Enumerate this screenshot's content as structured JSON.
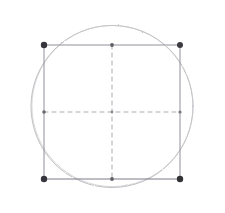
{
  "figure": {
    "title": "Square inscribed in a circle with dashed medians",
    "background_color": "#ffffff",
    "width": 225,
    "height": 213,
    "style": "hand-drawn pencil sketch, scanned, light gray strokes"
  },
  "chart_data": {
    "type": "scatter",
    "title": "Square inscribed in a circle with dashed medians",
    "xlabel": "",
    "ylabel": "",
    "grid": false,
    "legend": null,
    "xlim": [
      0,
      225
    ],
    "ylim": [
      0,
      213
    ],
    "shapes": [
      {
        "name": "circumscribed-circle",
        "kind": "circle",
        "cx": 112,
        "cy": 106.5,
        "r": 81,
        "stroke": "#b9b9bd",
        "stroke_width": 0.9,
        "dash": "none",
        "fill": "none"
      },
      {
        "name": "inscribed-square",
        "kind": "rect",
        "x": 44,
        "y": 45,
        "width": 136,
        "height": 134,
        "stroke": "#8e8e93",
        "stroke_width": 1.0,
        "dash": "none",
        "fill": "none"
      },
      {
        "name": "vertical-median",
        "kind": "line",
        "x1": 112,
        "y1": 45,
        "x2": 112,
        "y2": 179,
        "stroke": "#a8a8ad",
        "stroke_width": 0.9,
        "dash": "4 4"
      },
      {
        "name": "horizontal-median",
        "kind": "line",
        "x1": 44,
        "y1": 112,
        "x2": 180,
        "y2": 112,
        "stroke": "#a8a8ad",
        "stroke_width": 0.9,
        "dash": "4 4"
      }
    ],
    "points": [
      {
        "name": "vertex-top-left",
        "x": 44,
        "y": 45,
        "marker": "dot",
        "size": 3.4,
        "color": "#2f2f33"
      },
      {
        "name": "vertex-top-right",
        "x": 180,
        "y": 45,
        "marker": "dot",
        "size": 3.4,
        "color": "#2f2f33"
      },
      {
        "name": "vertex-bottom-left",
        "x": 44,
        "y": 179,
        "marker": "dot",
        "size": 3.4,
        "color": "#2f2f33"
      },
      {
        "name": "vertex-bottom-right",
        "x": 180,
        "y": 179,
        "marker": "dot",
        "size": 3.4,
        "color": "#2f2f33"
      },
      {
        "name": "midpoint-top",
        "x": 112,
        "y": 45,
        "marker": "dot",
        "size": 2.0,
        "color": "#5a5a5f"
      },
      {
        "name": "midpoint-bottom",
        "x": 112,
        "y": 179,
        "marker": "dot",
        "size": 2.0,
        "color": "#5a5a5f"
      },
      {
        "name": "midpoint-left",
        "x": 44,
        "y": 112,
        "marker": "dot",
        "size": 2.0,
        "color": "#5a5a5f"
      },
      {
        "name": "midpoint-right",
        "x": 180,
        "y": 112,
        "marker": "dot",
        "size": 2.0,
        "color": "#5a5a5f"
      },
      {
        "name": "center",
        "x": 112,
        "y": 112,
        "marker": "dot",
        "size": 1.6,
        "color": "#8a8a8f"
      }
    ],
    "annotations": []
  },
  "colors": {
    "background": "#ffffff",
    "circle_stroke": "#b9b9bd",
    "square_stroke": "#8e8e93",
    "median_stroke": "#a8a8ad",
    "vertex_marker": "#2f2f33",
    "midpoint_marker": "#5a5a5f"
  }
}
